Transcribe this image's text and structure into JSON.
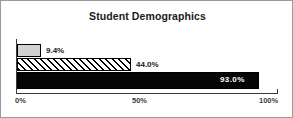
{
  "chart_data": {
    "type": "bar",
    "orientation": "horizontal",
    "title": "Student Demographics",
    "xlabel": "",
    "ylabel": "",
    "xlim": [
      0,
      100
    ],
    "grid": false,
    "legend": false,
    "categories": [
      "Series 1",
      "Series 2",
      "Series 3"
    ],
    "values": [
      9.4,
      44.0,
      93.0
    ],
    "data_labels": [
      "9.4%",
      "44.0%",
      "93.0%"
    ],
    "tick_labels": [
      "0%",
      "50%",
      "100%"
    ],
    "tick_values": [
      0,
      50,
      100
    ],
    "bar_styles": [
      "solid-light-gray",
      "diagonal-hatch",
      "solid-black"
    ]
  },
  "colors": {
    "frame_border": "#9a9a9a",
    "axis": "#3a3a3a",
    "bar_1_fill": "#d2d2d2",
    "bar_2_fill": "#ffffff",
    "bar_2_hatch": "#000000",
    "bar_3_fill": "#050505",
    "bar_outline": "#000000",
    "label_text": "#1a1a1a",
    "inside_label_text": "#ffffff",
    "tick_text": "#3c3c3c",
    "background": "#ffffff"
  }
}
